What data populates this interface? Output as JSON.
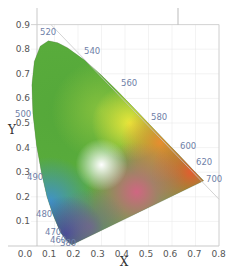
{
  "chart_data": {
    "type": "area",
    "title": "",
    "subtitle": "CIE 1931 xy chromaticity diagram",
    "xlabel": "X",
    "ylabel": "Y",
    "xlim": [
      0.0,
      0.8
    ],
    "ylim": [
      0.0,
      0.9
    ],
    "grid": true,
    "legend": null,
    "x_ticks": [
      "0.0",
      "0.1",
      "0.2",
      "0.3",
      "0.4",
      "0.5",
      "0.6",
      "0.7",
      "0.8"
    ],
    "y_ticks": [
      "0.1",
      "0.2",
      "0.3",
      "0.4",
      "0.5",
      "0.6",
      "0.7",
      "0.8",
      "0.9"
    ],
    "spectral_locus": {
      "wavelengths_nm": [
        380,
        460,
        470,
        480,
        490,
        500,
        520,
        540,
        560,
        580,
        600,
        620,
        700
      ],
      "x": [
        0.174,
        0.144,
        0.124,
        0.091,
        0.045,
        0.008,
        0.074,
        0.23,
        0.373,
        0.512,
        0.627,
        0.691,
        0.735
      ],
      "y": [
        0.005,
        0.03,
        0.058,
        0.133,
        0.295,
        0.538,
        0.834,
        0.754,
        0.625,
        0.487,
        0.373,
        0.308,
        0.265
      ]
    },
    "annotations": [
      "380",
      "460",
      "470",
      "480",
      "490",
      "500",
      "520",
      "540",
      "560",
      "580",
      "600",
      "620",
      "700"
    ],
    "reference_line": {
      "from": [
        0.0,
        0.9
      ],
      "to": [
        0.8,
        0.2
      ],
      "description": "light gray diagonal boundary line"
    }
  },
  "colors": {
    "green": "#5aad3c",
    "yellow": "#f0ea3a",
    "orange": "#f7892e",
    "red": "#f2542e",
    "magenta": "#e45a8e",
    "blue": "#3d8fd8",
    "violet": "#3a3f9a",
    "white_point": "#ffffff",
    "label": "#6f7fa8",
    "tick": "#555555",
    "grid": "#e6e6e6"
  }
}
